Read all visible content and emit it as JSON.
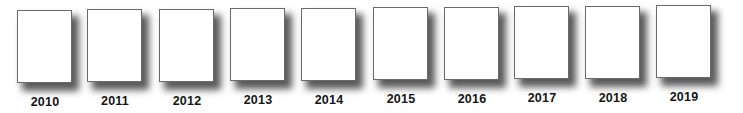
{
  "title": "",
  "years": [
    {
      "label": "2010",
      "x": 17,
      "y": 10
    },
    {
      "label": "2011",
      "x": 87,
      "y": 9
    },
    {
      "label": "2012",
      "x": 159,
      "y": 9
    },
    {
      "label": "2013",
      "x": 230,
      "y": 8
    },
    {
      "label": "2014",
      "x": 301,
      "y": 8
    },
    {
      "label": "2015",
      "x": 373,
      "y": 7
    },
    {
      "label": "2016",
      "x": 444,
      "y": 7
    },
    {
      "label": "2017",
      "x": 514,
      "y": 6
    },
    {
      "label": "2018",
      "x": 585,
      "y": 6
    },
    {
      "label": "2019",
      "x": 656,
      "y": 5
    }
  ],
  "colors": {
    "page_fill": "#ffffff",
    "page_border": "#6a6a6a",
    "shadow": "#000000",
    "label": "#151515"
  }
}
